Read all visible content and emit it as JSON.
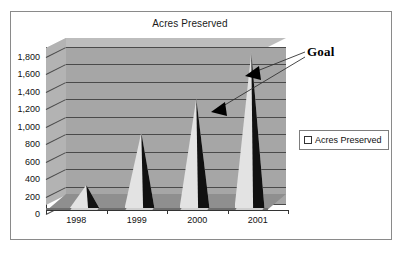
{
  "chart_data": {
    "type": "bar",
    "title": "Acres Preserved",
    "xlabel": "",
    "ylabel": "",
    "categories": [
      "1998",
      "1999",
      "2000",
      "2001"
    ],
    "values": [
      270,
      870,
      1260,
      1790
    ],
    "series": [
      {
        "name": "Acres Preserved",
        "values": [
          270,
          870,
          1260,
          1790
        ]
      }
    ],
    "ylim": [
      0,
      1800
    ],
    "ytick_step": 200,
    "ytick_labels": [
      "1,800",
      "1,600",
      "1,400",
      "1,200",
      "1,000",
      "800",
      "600",
      "400",
      "200",
      "0"
    ],
    "grid": true,
    "legend_position": "right",
    "legend_entries": [
      "Acres Preserved"
    ],
    "annotations": [
      {
        "text": "Goal",
        "points_to": [
          "2001",
          "2000"
        ]
      }
    ],
    "style": "3d-cone",
    "colors": {
      "cone_light": "#e3e3e3",
      "cone_dark": "#111111",
      "back_wall": "#a6a6a6",
      "top_face": "#bdbdbd",
      "floor": "#8f8f8f",
      "gridline": "#4a4a4a",
      "axis": "#333333",
      "frame_border": "#8a8a8a",
      "text": "#111111"
    }
  },
  "chart": {
    "title": "Acres Preserved"
  },
  "yaxis": {
    "labels": [
      "1,800",
      "1,600",
      "1,400",
      "1,200",
      "1,000",
      "800",
      "600",
      "400",
      "200",
      "0"
    ]
  },
  "xaxis": {
    "labels": [
      "1998",
      "1999",
      "2000",
      "2001"
    ]
  },
  "legend": {
    "marker": "square-marker-icon",
    "label": "Acres Preserved"
  },
  "annotation": {
    "goal_label": "Goal"
  }
}
